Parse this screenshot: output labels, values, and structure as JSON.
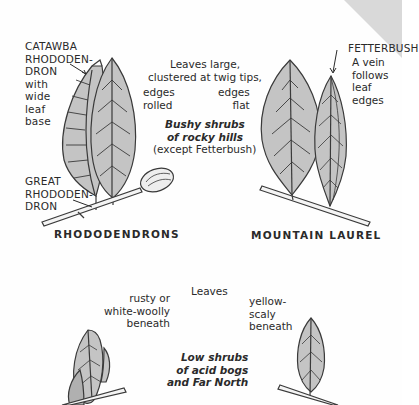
{
  "upper_panel": {
    "catawba_label": "CATAWBA\nRHODODEN-\nDRON\nwith\nwide\nleaf\nbase",
    "great_label": "GREAT\nRHODODEN-\nDRON",
    "center_note": "Leaves large,\nclustered at twig tips,",
    "edges_rolled": "edges\nrolled",
    "edges_flat": "edges\nflat",
    "habitat": "Bushy shrubs\nof rocky hills",
    "habitat_exception": "(except Fetterbush)",
    "fetterbush_label": "FETTERBUSH",
    "fetterbush_note": "A vein\nfollows\nleaf\nedges",
    "group_left": "RHODODENDRONS",
    "group_right": "MOUNTAIN LAUREL"
  },
  "lower_panel": {
    "leaves_label": "Leaves",
    "left_note": "rusty or\nwhite-woolly\nbeneath",
    "right_note": "yellow-\nscaly\nbeneath",
    "habitat": "Low shrubs\nof acid bogs\nand Far North"
  },
  "colors": {
    "leaf_fill": "#c4c4c4",
    "outline": "#3a3a3a",
    "corner": "#d9d9d9"
  }
}
